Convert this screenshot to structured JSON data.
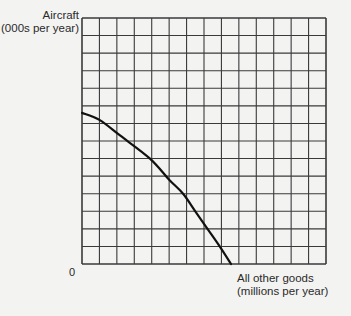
{
  "chart_data": {
    "type": "line",
    "title": "",
    "ylabel": "Aircraft (000s per year)",
    "xlabel": "All other goods (millions per year)",
    "ylabel_lines": [
      "Aircraft",
      "(000s per year)"
    ],
    "xlabel_lines": [
      "All other goods",
      "(millions per year)"
    ],
    "origin_label": "0",
    "grid": true,
    "grid_columns": 14,
    "grid_rows": 14,
    "xlim": [
      0,
      14
    ],
    "ylim": [
      0,
      14
    ],
    "series": [
      {
        "name": "Production possibilities frontier",
        "x": [
          0,
          1.0,
          2.2,
          3.9,
          5.0,
          5.8,
          6.5,
          7.2,
          7.9,
          8.55
        ],
        "y": [
          8.6,
          8.2,
          7.3,
          6.0,
          4.8,
          4.0,
          3.0,
          2.0,
          1.0,
          0
        ]
      }
    ],
    "intercepts": {
      "y_axis": 8.6,
      "x_axis": 8.55
    }
  },
  "colors": {
    "background": "#f3f3f1",
    "grid": "#3a3a3a",
    "curve": "#111111",
    "text": "#2a2a2a"
  }
}
